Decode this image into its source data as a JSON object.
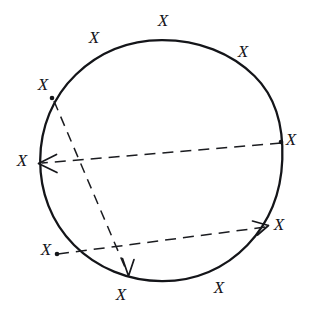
{
  "figure": {
    "background_color": "#ffffff",
    "ink_color": "#15161a",
    "width": 314,
    "height": 316
  },
  "circle": {
    "label": "hand-drawn circle outline",
    "center_x": 161,
    "center_y": 161,
    "radius": 121,
    "stroke_color": "#141519",
    "stroke_width": 2.3
  },
  "x_markers": [
    {
      "id": "x-top",
      "text": "X",
      "x": 163,
      "y": 22,
      "position": "top"
    },
    {
      "id": "x-top-left",
      "text": "X",
      "x": 94,
      "y": 39,
      "position": "top-left"
    },
    {
      "id": "x-top-right",
      "text": "X",
      "x": 243,
      "y": 53,
      "position": "top-right"
    },
    {
      "id": "x-upper-left",
      "text": "X",
      "x": 43,
      "y": 86,
      "position": "upper-left"
    },
    {
      "id": "x-right",
      "text": "X",
      "x": 291,
      "y": 141,
      "position": "right"
    },
    {
      "id": "x-left",
      "text": "X",
      "x": 22,
      "y": 162,
      "position": "left"
    },
    {
      "id": "x-lower-right",
      "text": "X",
      "x": 279,
      "y": 226,
      "position": "lower-right"
    },
    {
      "id": "x-lower-left",
      "text": "X",
      "x": 46,
      "y": 251,
      "position": "lower-left"
    },
    {
      "id": "x-bottom",
      "text": "X",
      "x": 121,
      "y": 296,
      "position": "bottom"
    },
    {
      "id": "x-bottom-right",
      "text": "X",
      "x": 219,
      "y": 289,
      "position": "bottom-right"
    }
  ],
  "dots": [
    {
      "id": "dot-upper-left",
      "x": 52,
      "y": 98,
      "r": 2.2
    },
    {
      "id": "dot-right",
      "x": 281,
      "y": 142,
      "r": 2.2
    },
    {
      "id": "dot-lower-left",
      "x": 57,
      "y": 254,
      "r": 2.2
    }
  ],
  "vectors": [
    {
      "id": "vector-right-to-left",
      "description": "horizontal dashed arrow from right edge dot to left edge arrowhead",
      "from_x": 281,
      "from_y": 143,
      "to_x": 39,
      "to_y": 163,
      "dash": "11 7",
      "arrow_direction": "left"
    },
    {
      "id": "vector-lowerleft-to-lowerright",
      "description": "dashed arrow from lower-left dot up to lower-right circle edge arrowhead",
      "from_x": 58,
      "from_y": 254,
      "to_x": 266,
      "to_y": 226,
      "dash": "11 7",
      "arrow_direction": "right"
    },
    {
      "id": "vector-upperleft-to-bottom",
      "description": "diagonal dashed arrow from upper-left dot down to bottom circle edge arrowhead",
      "from_x": 54,
      "from_y": 101,
      "to_x": 128,
      "to_y": 275,
      "dash": "10 7",
      "arrow_direction": "down"
    }
  ]
}
